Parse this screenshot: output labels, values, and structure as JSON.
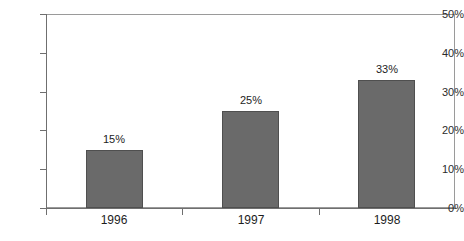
{
  "chart_data": {
    "type": "bar",
    "title": "",
    "subtitle": "",
    "xlabel": "",
    "ylabel": "",
    "categories": [
      "1996",
      "1997",
      "1998"
    ],
    "values": [
      15,
      25,
      33
    ],
    "value_labels": [
      "15%",
      "25%",
      "33%"
    ],
    "ylim": [
      0,
      50
    ],
    "ytick_values": [
      0,
      10,
      20,
      30,
      40,
      50
    ],
    "ytick_labels": [
      "0%",
      "10%",
      "20%",
      "30%",
      "40%",
      "50%"
    ],
    "grid": false,
    "legend": null,
    "series": [
      {
        "name": "",
        "values": [
          15,
          25,
          33
        ]
      }
    ],
    "colors": {
      "bar_fill": "#6a6a6a",
      "bar_edge": "#4f4f4f",
      "axis": "#6f6f6f",
      "frame": "#9a9a9a",
      "text": "#1d1d1d",
      "background": "#ffffff"
    }
  }
}
